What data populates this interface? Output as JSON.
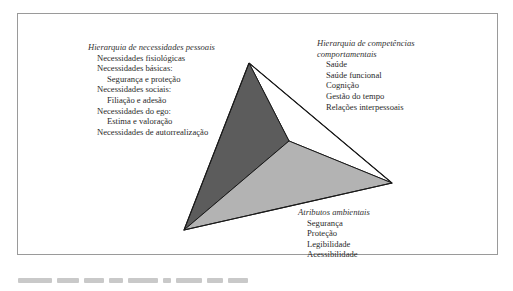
{
  "diagram": {
    "type": "tetrahedron-model",
    "colors": {
      "left_face": "#5c5c5c",
      "bottom_face": "#b3b3b3",
      "right_face": "#ffffff",
      "edge": "#1a1a1a",
      "frame": "#9a9a9a"
    },
    "vertices": {
      "top": [
        249,
        63
      ],
      "bottom_left": [
        184,
        230
      ],
      "right": [
        392,
        183
      ],
      "inner": [
        289,
        141
      ]
    }
  },
  "labels": {
    "personal_needs": {
      "title": "Hierarquia de necessidades pessoais",
      "items": [
        {
          "text": "Necessidades fisiológicas",
          "level": 1
        },
        {
          "text": "Necessidades básicas:",
          "level": 1
        },
        {
          "text": "Segurança e proteção",
          "level": 2
        },
        {
          "text": "Necessidades sociais:",
          "level": 1
        },
        {
          "text": "Filiação e adesão",
          "level": 2
        },
        {
          "text": "Necessidades do ego:",
          "level": 1
        },
        {
          "text": "Estima e valoração",
          "level": 2
        },
        {
          "text": "Necessidades de autorrealização",
          "level": 1
        }
      ]
    },
    "behavioral_competencies": {
      "title_line1": "Hierarquia de competências",
      "title_line2": "comportamentais",
      "items": [
        "Saúde",
        "Saúde funcional",
        "Cognição",
        "Gestão do tempo",
        "Relações interpessoais"
      ]
    },
    "environmental_attributes": {
      "title": "Atributos ambientais",
      "items": [
        "Segurança",
        "Proteção",
        "Legibilidade",
        "Acessibilidade"
      ]
    }
  }
}
